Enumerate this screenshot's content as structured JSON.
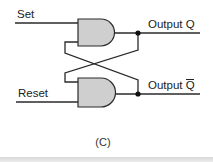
{
  "diagram": {
    "type": "SR latch (cross-coupled gates)",
    "labels": {
      "set": "Set",
      "reset": "Reset",
      "output_q": "Output Q",
      "output_q_bar_prefix": "Output ",
      "output_q_bar_symbol": "Q"
    },
    "caption": "(C)",
    "gates": [
      {
        "id": "top-gate",
        "inputs": [
          "Set",
          "feedback from Output Q̄"
        ],
        "output": "Output Q"
      },
      {
        "id": "bottom-gate",
        "inputs": [
          "feedback from Output Q",
          "Reset"
        ],
        "output": "Output Q̄"
      }
    ],
    "colors": {
      "gate_fill": "#cfcfcf",
      "wire": "#2a2a2a",
      "junction_dot": "#111111"
    }
  }
}
